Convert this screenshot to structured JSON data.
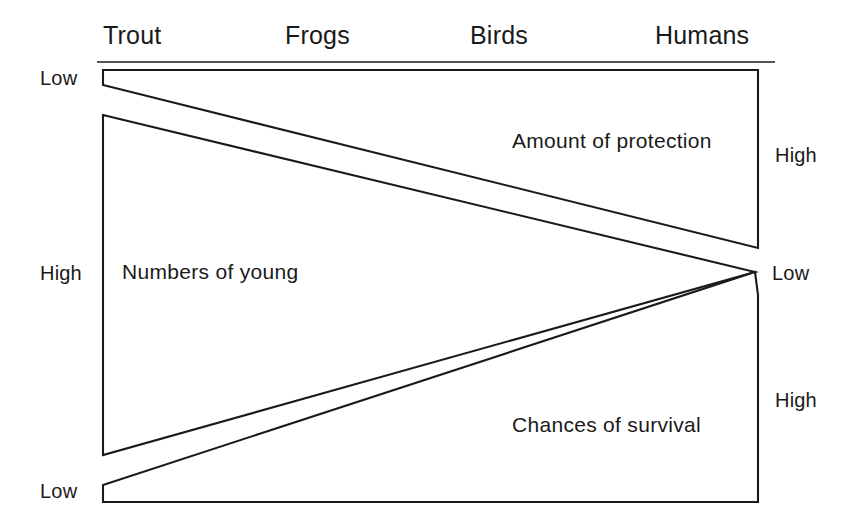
{
  "figure": {
    "column_headers": [
      {
        "label": "Trout",
        "x": 103
      },
      {
        "label": "Frogs",
        "x": 285
      },
      {
        "label": "Birds",
        "x": 470
      },
      {
        "label": "Humans",
        "x": 655
      }
    ],
    "header_rule": {
      "x1": 97,
      "x2": 775,
      "y": 62
    },
    "wedges": [
      {
        "name": "amount-of-protection",
        "label": "Amount of protection",
        "label_x": 512,
        "label_y": 148,
        "points": "103,70 758,70 758,248 103,85",
        "left_level": "Low",
        "right_level": "High"
      },
      {
        "name": "numbers-of-young",
        "label": "Numbers of young",
        "label_x": 122,
        "label_y": 279,
        "points": "103,115 755,272 103,455",
        "left_level": "High",
        "right_level": "Low"
      },
      {
        "name": "chances-of-survival",
        "label": "Chances of survival",
        "label_x": 512,
        "label_y": 432,
        "points": "755,272 758,295 758,502 103,502 103,485",
        "left_level": "Low",
        "right_level": "High"
      }
    ],
    "axis_labels": [
      {
        "name": "left-low-protection",
        "text": "Low",
        "x": 40,
        "y": 85,
        "anchor": "start"
      },
      {
        "name": "left-high-numbers",
        "text": "High",
        "x": 40,
        "y": 280,
        "anchor": "start"
      },
      {
        "name": "left-low-survival",
        "text": "Low",
        "x": 40,
        "y": 498,
        "anchor": "start"
      },
      {
        "name": "right-high-protection",
        "text": "High",
        "x": 775,
        "y": 162,
        "anchor": "start"
      },
      {
        "name": "right-low-numbers",
        "text": "Low",
        "x": 772,
        "y": 280,
        "anchor": "start"
      },
      {
        "name": "right-high-survival",
        "text": "High",
        "x": 775,
        "y": 407,
        "anchor": "start"
      }
    ],
    "colors": {
      "stroke": "#1a1a1a",
      "background": "#ffffff"
    }
  }
}
